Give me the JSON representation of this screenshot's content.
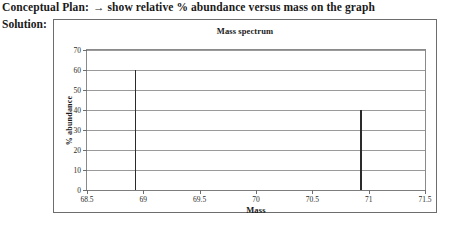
{
  "header": {
    "conceptual_plan_label": "Conceptual Plan:",
    "arrow": "→",
    "conceptual_plan_text": "show relative % abundance versus mass on the graph",
    "solution_label": "Solution:"
  },
  "chart_data": {
    "type": "bar",
    "title": "Mass spectrum",
    "xlabel": "Mass",
    "ylabel": "% abundance",
    "x": [
      68.93,
      70.93
    ],
    "values": [
      60,
      40
    ],
    "xlim": [
      68.5,
      71.5
    ],
    "ylim": [
      0,
      70
    ],
    "xticks": [
      68.5,
      69,
      69.5,
      70,
      70.5,
      71,
      71.5
    ],
    "xtick_labels": [
      "68.5",
      "69",
      "69.5",
      "70",
      "70.5",
      "71",
      "71.5"
    ],
    "yticks": [
      0,
      10,
      20,
      30,
      40,
      50,
      60,
      70
    ],
    "ytick_labels": [
      "0",
      "10",
      "20",
      "30",
      "40",
      "50",
      "60",
      "70"
    ],
    "grid": "horizontal",
    "legend": "none",
    "colors": {
      "peak": "#2b2b2b",
      "gridline": "#9a9a9a",
      "frame": "#8a8a8a",
      "box": "#6d6d6d"
    }
  }
}
